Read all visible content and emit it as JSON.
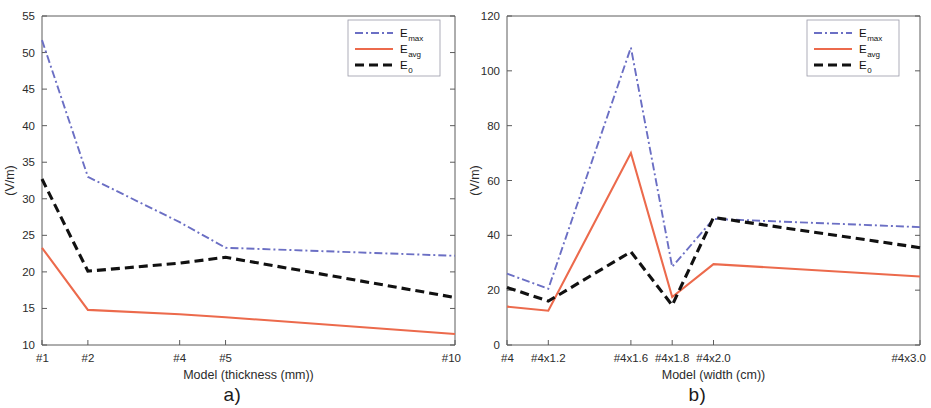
{
  "figure": {
    "panels": [
      {
        "caption": "a)",
        "ylabel": "(V/m)",
        "xlabel": "Model (thickness (mm))"
      },
      {
        "caption": "b)",
        "ylabel": "(V/m)",
        "xlabel": "Model (width (cm))"
      }
    ]
  },
  "legend": {
    "entries": [
      {
        "base": "E",
        "sub": "max",
        "color": "#6b6fc4",
        "style": "dash-dot"
      },
      {
        "base": "E",
        "sub": "avg",
        "color": "#ec6a4c",
        "style": "solid"
      },
      {
        "base": "E",
        "sub": "0",
        "color": "#111111",
        "style": "dashed"
      }
    ]
  },
  "colors": {
    "emax": "#6b6fc4",
    "eavg": "#ec6a4c",
    "e0": "#111111",
    "axis": "#5c5c5c",
    "text": "#2b2b2b"
  },
  "chart_data": [
    {
      "type": "line",
      "panel": "a)",
      "title": "",
      "xlabel": "Model (thickness (mm))",
      "ylabel": "(V/m)",
      "categories": [
        "#1",
        "#2",
        "#4",
        "#5",
        "#10"
      ],
      "x": [
        1,
        2,
        4,
        5,
        10
      ],
      "xtick_labels": [
        "#1",
        "#2",
        "#4",
        "#5",
        "#10"
      ],
      "xtick_values": [
        1,
        2,
        4,
        5,
        10
      ],
      "xlim": [
        1,
        10
      ],
      "ylim": [
        10,
        55
      ],
      "ytick_values": [
        10,
        15,
        20,
        25,
        30,
        35,
        40,
        45,
        50,
        55
      ],
      "grid": false,
      "legend_position": "top-right",
      "series": [
        {
          "name": "E_max",
          "values": [
            51.7,
            33.0,
            26.8,
            23.3,
            22.2
          ],
          "color": "#6b6fc4",
          "style": "dash-dot"
        },
        {
          "name": "E_avg",
          "values": [
            23.3,
            14.8,
            14.2,
            13.8,
            11.5
          ],
          "color": "#ec6a4c",
          "style": "solid"
        },
        {
          "name": "E_0",
          "values": [
            32.7,
            20.1,
            21.2,
            22.0,
            16.5
          ],
          "color": "#111111",
          "style": "dashed"
        }
      ]
    },
    {
      "type": "line",
      "panel": "b)",
      "title": "",
      "xlabel": "Model (width (cm))",
      "ylabel": "(V/m)",
      "categories": [
        "#4",
        "#4x1.2",
        "#4x1.6",
        "#4x1.8",
        "#4x2.0",
        "#4x3.0"
      ],
      "x": [
        1.0,
        1.2,
        1.6,
        1.8,
        2.0,
        3.0
      ],
      "xtick_labels": [
        "#4",
        "#4x1.2",
        "#4x1.6",
        "#4x1.8",
        "#4x2.0",
        "#4x3.0"
      ],
      "xtick_values": [
        1.0,
        1.2,
        1.6,
        1.8,
        2.0,
        3.0
      ],
      "xlim": [
        1.0,
        3.0
      ],
      "ylim": [
        0,
        120
      ],
      "ytick_values": [
        0,
        20,
        40,
        60,
        80,
        100,
        120
      ],
      "grid": false,
      "legend_position": "top-right",
      "series": [
        {
          "name": "E_max",
          "values": [
            26.0,
            20.5,
            108.5,
            28.5,
            46.0,
            43.0
          ],
          "color": "#6b6fc4",
          "style": "dash-dot"
        },
        {
          "name": "E_avg",
          "values": [
            14.0,
            12.5,
            70.0,
            17.5,
            29.5,
            25.0
          ],
          "color": "#ec6a4c",
          "style": "solid"
        },
        {
          "name": "E_0",
          "values": [
            21.0,
            16.0,
            34.0,
            14.5,
            46.5,
            35.5
          ],
          "color": "#111111",
          "style": "dashed"
        }
      ]
    }
  ]
}
